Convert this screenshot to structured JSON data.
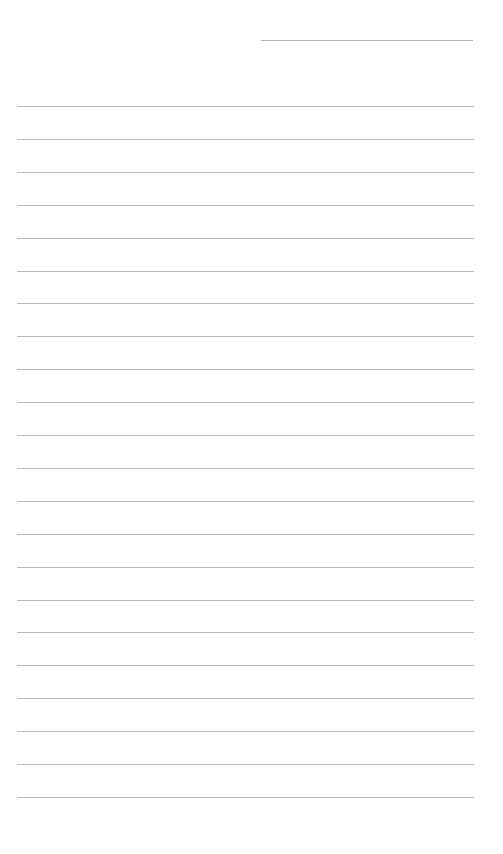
{
  "page": {
    "type": "lined-paper",
    "background": "#ffffff",
    "line_color": "#bdbdbd",
    "header_line": {
      "label": "",
      "x": 261,
      "y": 40,
      "width": 212
    },
    "rules": {
      "count": 22,
      "start_y": 106,
      "spacing": 32.9,
      "x": 17,
      "width": 457
    },
    "lines_text": [
      "",
      "",
      "",
      "",
      "",
      "",
      "",
      "",
      "",
      "",
      "",
      "",
      "",
      "",
      "",
      "",
      "",
      "",
      "",
      "",
      "",
      ""
    ]
  }
}
